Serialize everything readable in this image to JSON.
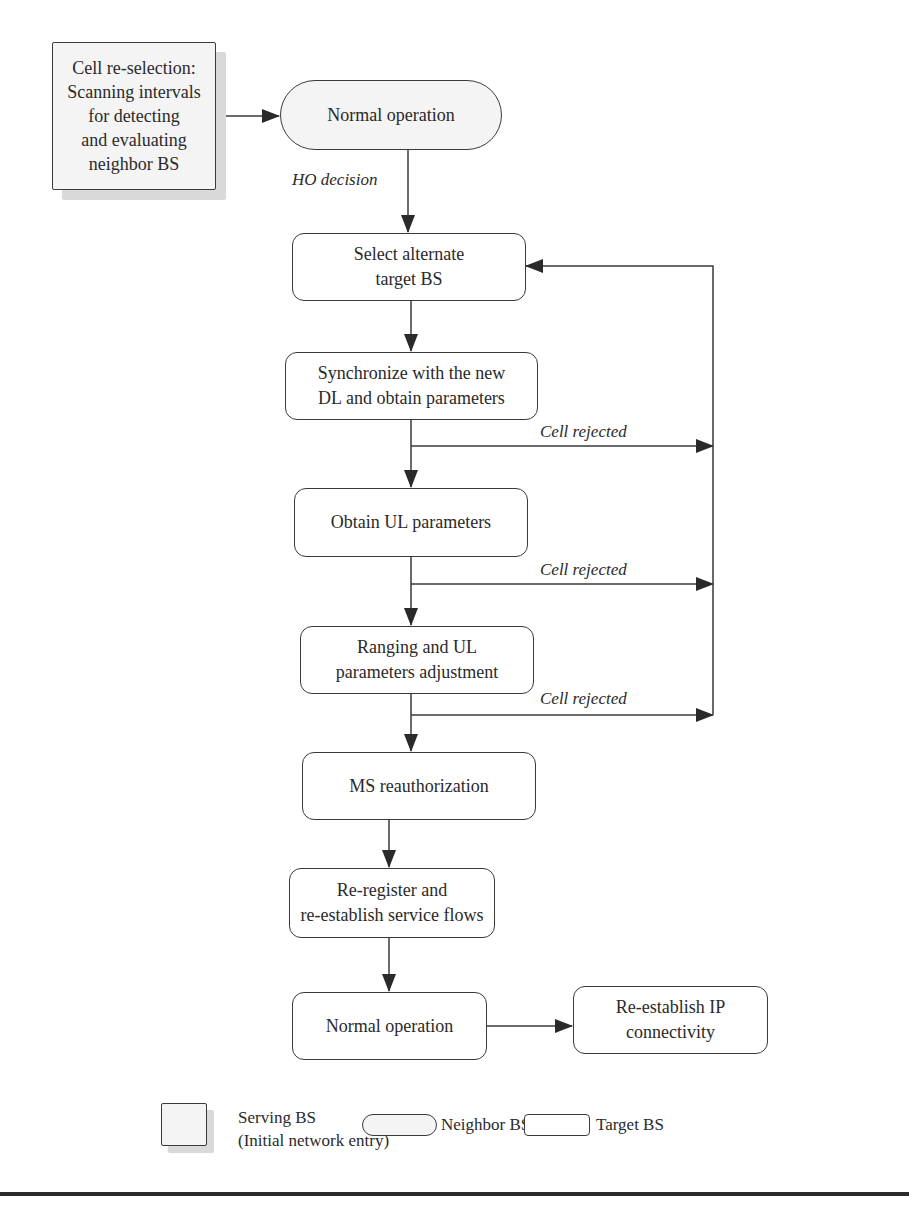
{
  "diagram": {
    "nodes": {
      "serving": "Cell re-selection: Scanning intervals for detecting and evaluating neighbor BS",
      "serving_lines": [
        "Cell re-selection:",
        "Scanning intervals",
        "for detecting",
        "and evaluating",
        "neighbor BS"
      ],
      "normal_top": "Normal operation",
      "select_target": [
        "Select alternate",
        "target BS"
      ],
      "sync_dl": [
        "Synchronize with the new",
        "DL and obtain parameters"
      ],
      "obtain_ul": "Obtain UL parameters",
      "ranging": [
        "Ranging and UL",
        "parameters adjustment"
      ],
      "reauth": "MS reauthorization",
      "reregister": [
        "Re-register and",
        "re-establish service flows"
      ],
      "normal_bottom": "Normal operation",
      "reestablish_ip": [
        "Re-establish IP",
        "connectivity"
      ]
    },
    "edge_labels": {
      "ho_decision": "HO decision",
      "cell_rejected_1": "Cell rejected",
      "cell_rejected_2": "Cell rejected",
      "cell_rejected_3": "Cell rejected"
    },
    "edges": [
      {
        "from": "serving",
        "to": "normal_top"
      },
      {
        "from": "normal_top",
        "to": "select_target",
        "label": "HO decision"
      },
      {
        "from": "select_target",
        "to": "sync_dl"
      },
      {
        "from": "sync_dl",
        "to": "obtain_ul"
      },
      {
        "from": "sync_dl",
        "to": "select_target",
        "label": "Cell rejected"
      },
      {
        "from": "obtain_ul",
        "to": "ranging"
      },
      {
        "from": "obtain_ul",
        "to": "select_target",
        "label": "Cell rejected"
      },
      {
        "from": "ranging",
        "to": "reauth"
      },
      {
        "from": "ranging",
        "to": "select_target",
        "label": "Cell rejected"
      },
      {
        "from": "reauth",
        "to": "reregister"
      },
      {
        "from": "reregister",
        "to": "normal_bottom"
      },
      {
        "from": "normal_bottom",
        "to": "reestablish_ip"
      }
    ]
  },
  "legend": {
    "serving": [
      "Serving BS",
      "(Initial network entry)"
    ],
    "neighbor": "Neighbor BS",
    "target": "Target BS"
  },
  "colors": {
    "stroke": "#3a3a3a",
    "fill_shaded": "#f4f4f4",
    "shadow": "#d9d9d9"
  }
}
